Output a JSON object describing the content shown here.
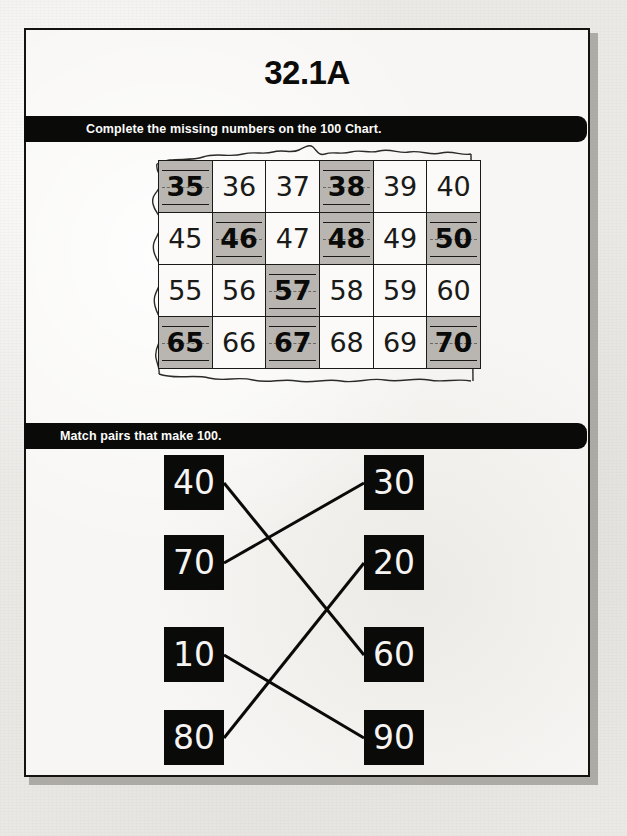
{
  "worksheet": {
    "title": "32.1A",
    "sections": [
      {
        "instruction": "Complete the missing numbers on the 100 Chart."
      },
      {
        "instruction": "Match pairs that make 100."
      }
    ],
    "colors": {
      "ink": "#0a0a09",
      "paper": "#f7f6f4",
      "shaded_cell": "#b9b6b1",
      "bar_background": "#0a0a09",
      "bar_text": "#fbfbfa"
    }
  },
  "hundred_chart": {
    "rows": 4,
    "columns": 6,
    "cells": [
      [
        {
          "value": "35",
          "filled_in": true
        },
        {
          "value": "36",
          "filled_in": false
        },
        {
          "value": "37",
          "filled_in": false
        },
        {
          "value": "38",
          "filled_in": true
        },
        {
          "value": "39",
          "filled_in": false
        },
        {
          "value": "40",
          "filled_in": false
        }
      ],
      [
        {
          "value": "45",
          "filled_in": false
        },
        {
          "value": "46",
          "filled_in": true
        },
        {
          "value": "47",
          "filled_in": false
        },
        {
          "value": "48",
          "filled_in": true
        },
        {
          "value": "49",
          "filled_in": false
        },
        {
          "value": "50",
          "filled_in": true
        }
      ],
      [
        {
          "value": "55",
          "filled_in": false
        },
        {
          "value": "56",
          "filled_in": false
        },
        {
          "value": "57",
          "filled_in": true
        },
        {
          "value": "58",
          "filled_in": false
        },
        {
          "value": "59",
          "filled_in": false
        },
        {
          "value": "60",
          "filled_in": false
        }
      ],
      [
        {
          "value": "65",
          "filled_in": true
        },
        {
          "value": "66",
          "filled_in": false
        },
        {
          "value": "67",
          "filled_in": true
        },
        {
          "value": "68",
          "filled_in": false
        },
        {
          "value": "69",
          "filled_in": false
        },
        {
          "value": "70",
          "filled_in": true
        }
      ]
    ]
  },
  "matching": {
    "left_column": [
      {
        "value": "40"
      },
      {
        "value": "70"
      },
      {
        "value": "10"
      },
      {
        "value": "80"
      }
    ],
    "right_column": [
      {
        "value": "30"
      },
      {
        "value": "20"
      },
      {
        "value": "60"
      },
      {
        "value": "90"
      }
    ],
    "connections": [
      {
        "left": "40",
        "right": "60"
      },
      {
        "left": "70",
        "right": "30"
      },
      {
        "left": "10",
        "right": "90"
      },
      {
        "left": "80",
        "right": "20"
      }
    ]
  }
}
